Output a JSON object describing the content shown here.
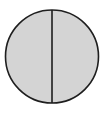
{
  "diagram": {
    "shape": "circle",
    "parts": 2,
    "shaded_parts": 2,
    "colors": {
      "fill": "#d4d4d4",
      "stroke": "#1e1e1e",
      "background": "#ffffff"
    },
    "geometry": {
      "cx": 52,
      "cy": 56.5,
      "r": 46.5,
      "divider_x": 52
    }
  }
}
